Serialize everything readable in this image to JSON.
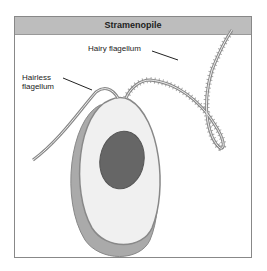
{
  "title": "Stramenopile",
  "labels": {
    "hairy": "Hairy flagellum",
    "hairless_line1": "Hairless",
    "hairless_line2": "flagellum"
  },
  "colors": {
    "header_bg": "#bdbdbd",
    "nucleus": "#666666",
    "cell_body": "#f0f0f0",
    "outline": "#8a8a8a"
  }
}
